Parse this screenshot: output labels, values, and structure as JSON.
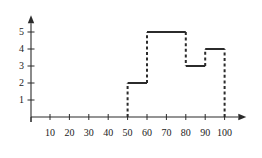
{
  "chart_data": {
    "type": "bar",
    "title": "",
    "subtitle": "",
    "xlabel": "",
    "ylabel": "",
    "style": "dashed-outline-histogram",
    "xlim": [
      0,
      105
    ],
    "ylim": [
      0,
      5.4
    ],
    "grid": false,
    "legend": null,
    "x_ticks": [
      10,
      20,
      30,
      40,
      50,
      60,
      70,
      80,
      90,
      100
    ],
    "x_tick_labels": [
      "10",
      "20",
      "30",
      "40",
      "50",
      "60",
      "70",
      "80",
      "90",
      "100"
    ],
    "y_ticks": [
      1,
      2,
      3,
      4,
      5
    ],
    "y_tick_labels": [
      "1",
      "2",
      "3",
      "4",
      "5"
    ],
    "bins": [
      {
        "label": "50-60",
        "x0": 50,
        "x1": 60,
        "value": 2
      },
      {
        "label": "60-80",
        "x0": 60,
        "x1": 80,
        "value": 5
      },
      {
        "label": "80-90",
        "x0": 80,
        "x1": 90,
        "value": 3
      },
      {
        "label": "90-100",
        "x0": 90,
        "x1": 100,
        "value": 4
      }
    ],
    "categories": [
      "50-60",
      "60-80",
      "80-90",
      "90-100"
    ],
    "values": [
      2,
      5,
      3,
      4
    ],
    "colors": {
      "axis": "#2b2b2b",
      "series": "#2b2b2b",
      "background": "#ffffff",
      "label": "#1b1b1b"
    },
    "annotations": []
  },
  "axes": {
    "x_axis_name": "x-axis",
    "y_axis_name": "y-axis",
    "x_arrow": true,
    "y_arrow": true
  }
}
